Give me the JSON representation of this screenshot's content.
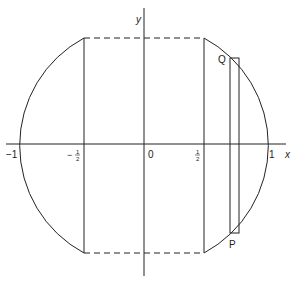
{
  "diagram": {
    "axes": {
      "x_label": "x",
      "y_label": "y"
    },
    "tick_labels": {
      "neg_one": "−1",
      "neg_half_minus": "−",
      "neg_half_num": "1",
      "neg_half_den": "2",
      "zero": "0",
      "half_num": "1",
      "half_den": "2",
      "one": "1"
    },
    "points": {
      "Q": "Q",
      "P": "P"
    },
    "colors": {
      "line": "#222222",
      "background": "#ffffff"
    }
  }
}
